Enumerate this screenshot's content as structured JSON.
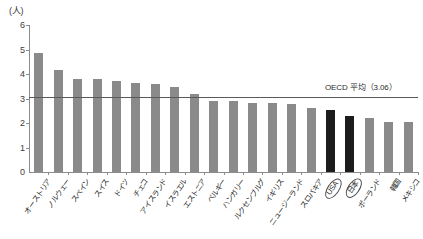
{
  "chart_data": {
    "type": "bar",
    "title": "",
    "subtitle": "",
    "unit_label": "(人)",
    "xlabel": "",
    "ylabel": "",
    "ylim": [
      0,
      6
    ],
    "yticks": [
      0,
      1,
      2,
      3,
      4,
      5,
      6
    ],
    "ytick_labels": [
      "0",
      "1",
      "2",
      "3",
      "4",
      "5",
      "6"
    ],
    "grid": false,
    "legend": null,
    "categories": [
      "オーストリア",
      "ノルウェー",
      "スペイン",
      "スイス",
      "ドイツ",
      "チェコ",
      "アイスランド",
      "イスラエル",
      "エストニア",
      "ベルギー",
      "ハンガリー",
      "ルクセンブルグ",
      "イギリス",
      "ニュージーランド",
      "スロバキア",
      "USA",
      "日本",
      "ポーランド",
      "韓国",
      "メキシコ"
    ],
    "highlighted_categories": [
      "USA",
      "日本"
    ],
    "values": [
      4.86,
      4.15,
      3.8,
      3.8,
      3.7,
      3.63,
      3.6,
      3.47,
      3.17,
      2.9,
      2.88,
      2.82,
      2.81,
      2.77,
      2.6,
      2.52,
      2.3,
      2.2,
      2.05,
      2.05
    ],
    "bar_color": "#8a8a8a",
    "highlight_bar_color": "#1c1c1c",
    "reference_line": {
      "label": "OECD 平均（3.06）",
      "value": 3.06,
      "color": "#5a5a5a"
    }
  }
}
